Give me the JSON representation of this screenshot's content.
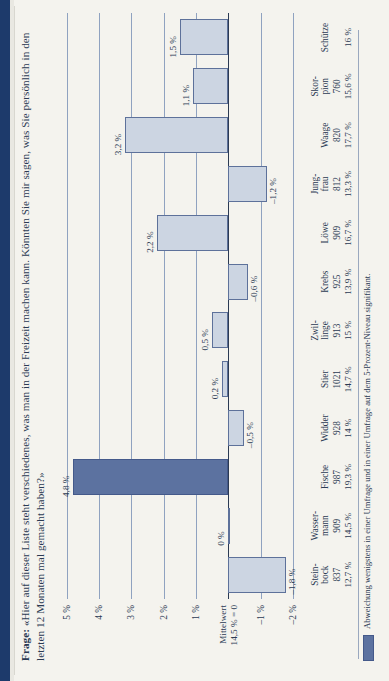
{
  "title": {
    "label": "Frage:",
    "text": "«Hier auf dieser Liste steht verschiedenes, was man in der Freizeit machen kann. Könnten Sie mir sagen, was Sie persönlich in den letzten 12 Monaten mal gemacht haben?»"
  },
  "footnote": {
    "text": "Abweichung wenigstens in einer Umfrage und in einer Umfrage auf dem 5-Prozent-Niveau signifikant."
  },
  "colors": {
    "bar_fill": "#ccd5e2",
    "bar_stroke": "#5d719a",
    "highlight_fill": "#5c72a0",
    "text": "#2b3a53",
    "grid": "#8fa2c0",
    "page_band": "#1d3a6b"
  },
  "chart_data": {
    "type": "bar",
    "orientation": "vertical",
    "xlabel": "",
    "ylabel": "",
    "ylim": [
      -2.4,
      5.4
    ],
    "grid": true,
    "legend": "Abweichung wenigstens in einer Umfrage und in einer Umfrage auf dem 5-Prozent-Niveau signifikant.",
    "yticks": [
      5,
      4,
      3,
      2,
      1,
      0,
      -1,
      -2
    ],
    "ytick_labels": [
      "5 %",
      "4 %",
      "3 %",
      "2 %",
      "1 %",
      "Mittelwert\n14,5 % = 0",
      "–1 %",
      "–2 %"
    ],
    "mean_label_line1": "Mittelwert",
    "mean_label_line2": "14,5 % = 0",
    "categories": [
      "Steinbock",
      "Wassermann",
      "Fische",
      "Widder",
      "Stier",
      "Zwillinge",
      "Krebs",
      "Löwe",
      "Jungfrau",
      "Waage",
      "Skorpion",
      "Schütze"
    ],
    "category_lines": [
      [
        "Stein-",
        "bock"
      ],
      [
        "Wasser-",
        "mann"
      ],
      [
        "",
        "Fische"
      ],
      [
        "",
        "Widder"
      ],
      [
        "",
        "Stier"
      ],
      [
        "Zwil-",
        "linge"
      ],
      [
        "",
        "Krebs"
      ],
      [
        "",
        "Löwe"
      ],
      [
        "Jung-",
        "frau"
      ],
      [
        "",
        "Waage"
      ],
      [
        "Skor-",
        "pion"
      ],
      [
        "",
        "Schütze"
      ]
    ],
    "values": [
      -1.8,
      0,
      4.8,
      -0.5,
      0.2,
      0.5,
      -0.6,
      2.2,
      -1.2,
      3.2,
      1.1,
      1.5
    ],
    "value_labels": [
      "–1,8 %",
      "0 %",
      "4,8 %",
      "–0,5 %",
      "0,2 %",
      "0,5 %",
      "–0,6 %",
      "2,2 %",
      "–1,2 %",
      "3,2 %",
      "1,1 %",
      "1,5 %"
    ],
    "n_header": "n",
    "n_values": [
      837,
      909,
      987,
      928,
      1021,
      913,
      925,
      909,
      812,
      820,
      760
    ],
    "n_labels": [
      "837",
      "909",
      "987",
      "928",
      "1021",
      "913",
      "925",
      "909",
      "812",
      "820",
      "760",
      ""
    ],
    "pct_labels": [
      "12,7 %",
      "14,5 %",
      "19,3 %",
      "14 %",
      "14,7 %",
      "15 %",
      "13,9 %",
      "16,7 %",
      "13,3 %",
      "17,7 %",
      "15,6 %",
      "16 %"
    ],
    "highlight_index": 2
  }
}
